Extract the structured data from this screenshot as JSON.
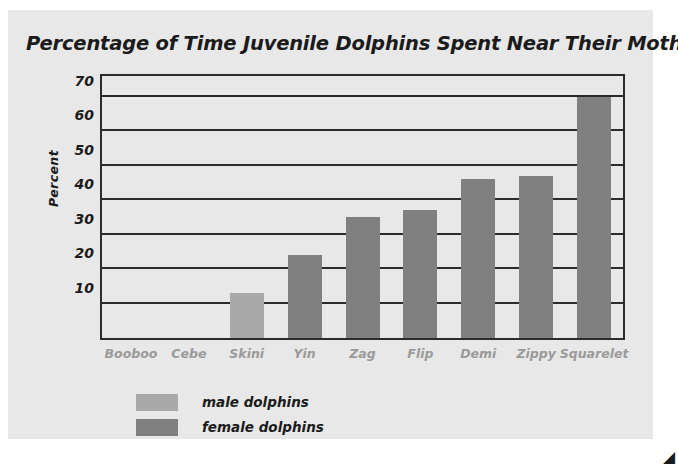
{
  "chart_data": {
    "type": "bar",
    "title": "Percentage of Time Juvenile Dolphins Spent Near Their Mothers",
    "xlabel": "",
    "ylabel": "Percent",
    "categories": [
      "Booboo",
      "Cebe",
      "Skini",
      "Yin",
      "Zag",
      "Flip",
      "Demi",
      "Zippy",
      "Squarelet"
    ],
    "values": [
      0,
      0,
      13,
      24,
      35,
      37,
      46,
      47,
      70
    ],
    "bar_groups": [
      "male",
      "male",
      "male",
      "female",
      "female",
      "female",
      "female",
      "female",
      "female"
    ],
    "ylim": [
      0,
      76
    ],
    "yticks": [
      10,
      20,
      30,
      40,
      50,
      60,
      70
    ],
    "ytick_labels": [
      "10",
      "20",
      "30",
      "40",
      "50",
      "60",
      "70"
    ],
    "grid": true,
    "legend_position": "below-left",
    "series": [
      {
        "name": "male dolphins",
        "color": "#a9a9a9"
      },
      {
        "name": "female dolphins",
        "color": "#808080"
      }
    ]
  },
  "legend": {
    "items": [
      {
        "label": "male dolphins",
        "color": "#a9a9a9"
      },
      {
        "label": "female dolphins",
        "color": "#808080"
      }
    ]
  },
  "colors": {
    "card_background": "#e8e8e8",
    "page_background": "#ffffff",
    "axis": "#2b2b2b",
    "tick_text": "#1b1b1b",
    "xtick_text": "#9a9a9a",
    "male_bar": "#a9a9a9",
    "female_bar": "#808080"
  },
  "artifacts": {
    "corner_mark": "◢"
  }
}
